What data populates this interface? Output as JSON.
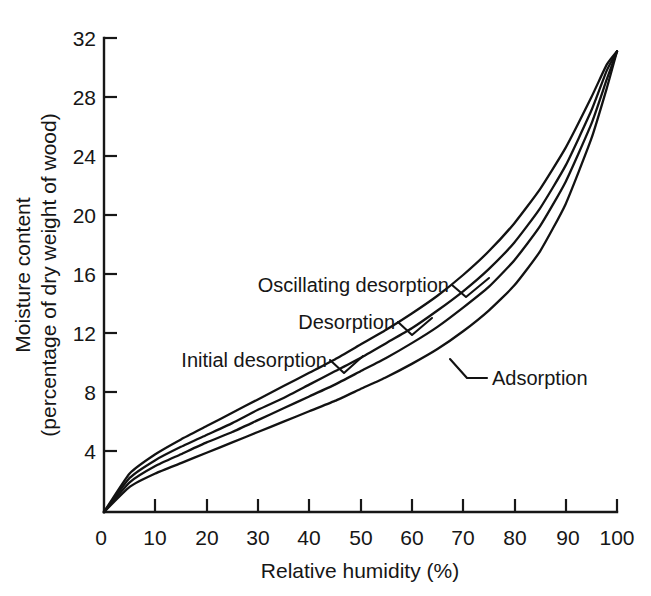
{
  "chart_data": {
    "type": "line",
    "title": "",
    "xlabel": "Relative humidity (%)",
    "ylabel_line1": "Moisture content",
    "ylabel_line2": "(percentage of dry weight of wood)",
    "xlim": [
      0,
      100
    ],
    "ylim": [
      0,
      32
    ],
    "grid": false,
    "legend_position": "inline-annotations",
    "xticks": [
      0,
      10,
      20,
      30,
      40,
      50,
      60,
      70,
      80,
      90,
      100
    ],
    "xtick_labels": [
      "0",
      "10",
      "20",
      "30",
      "40",
      "50",
      "60",
      "70",
      "80",
      "90",
      "100"
    ],
    "yticks": [
      0,
      4,
      8,
      12,
      16,
      20,
      24,
      28,
      32
    ],
    "ytick_labels": [
      "0",
      "4",
      "8",
      "12",
      "16",
      "20",
      "24",
      "28",
      "32"
    ],
    "x": [
      0,
      5,
      10,
      15,
      20,
      25,
      30,
      35,
      40,
      45,
      50,
      55,
      60,
      65,
      70,
      75,
      80,
      85,
      90,
      95,
      98,
      100
    ],
    "series": [
      {
        "name": "Oscillating desorption",
        "label": "Oscillating desorption",
        "values": [
          0,
          2.6,
          3.9,
          4.9,
          5.8,
          6.7,
          7.6,
          8.5,
          9.4,
          10.3,
          11.3,
          12.3,
          13.4,
          14.6,
          16.0,
          17.6,
          19.5,
          21.8,
          24.6,
          28.0,
          30.2,
          31.1
        ]
      },
      {
        "name": "Desorption",
        "label": "Desorption",
        "values": [
          0,
          2.3,
          3.5,
          4.4,
          5.2,
          6.0,
          6.9,
          7.7,
          8.6,
          9.5,
          10.4,
          11.4,
          12.4,
          13.6,
          14.9,
          16.4,
          18.2,
          20.5,
          23.4,
          27.1,
          29.8,
          31.1
        ]
      },
      {
        "name": "Initial desorption",
        "label": "Initial desorption",
        "values": [
          0,
          2.0,
          3.1,
          3.9,
          4.7,
          5.4,
          6.2,
          7.0,
          7.8,
          8.6,
          9.5,
          10.4,
          11.4,
          12.5,
          13.8,
          15.2,
          17.0,
          19.3,
          22.3,
          26.2,
          29.2,
          31.1
        ]
      },
      {
        "name": "Adsorption",
        "label": "Adsorption",
        "values": [
          0,
          1.7,
          2.6,
          3.3,
          4.0,
          4.7,
          5.4,
          6.1,
          6.8,
          7.5,
          8.3,
          9.1,
          10.0,
          11.0,
          12.2,
          13.6,
          15.3,
          17.6,
          20.8,
          25.2,
          28.6,
          31.1
        ]
      }
    ],
    "annotations": [
      {
        "text": "Oscillating desorption",
        "series": "Oscillating desorption"
      },
      {
        "text": "Desorption",
        "series": "Desorption"
      },
      {
        "text": "Initial desorption",
        "series": "Initial desorption"
      },
      {
        "text": "Adsorption",
        "series": "Adsorption"
      }
    ],
    "colors": {
      "ink": "#121212",
      "background": "#ffffff"
    }
  }
}
